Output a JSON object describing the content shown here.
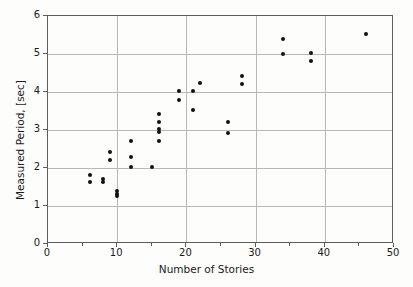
{
  "chart_data": {
    "type": "scatter",
    "title": "",
    "xlabel": "Number of Stories",
    "ylabel": "Measured Period, [sec]",
    "xlim": [
      0,
      50
    ],
    "ylim": [
      0,
      6
    ],
    "xticks": [
      0,
      10,
      20,
      30,
      40,
      50
    ],
    "yticks": [
      0,
      1,
      2,
      3,
      4,
      5,
      6
    ],
    "xtick_labels": [
      "0",
      "10",
      "20",
      "30",
      "40",
      "50"
    ],
    "ytick_labels": [
      "0",
      "1",
      "2",
      "3",
      "4",
      "5",
      "6"
    ],
    "x_minor_ticks": [
      5,
      15,
      25,
      35,
      45
    ],
    "grid": true,
    "grid_color": "#b9b9b9",
    "legend": null,
    "marker": "circle",
    "marker_color": "#111111",
    "marker_size": 4,
    "points": [
      {
        "x": 6,
        "y": 1.82
      },
      {
        "x": 6,
        "y": 1.62
      },
      {
        "x": 8,
        "y": 1.7
      },
      {
        "x": 8,
        "y": 1.62
      },
      {
        "x": 9,
        "y": 2.42
      },
      {
        "x": 9,
        "y": 2.22
      },
      {
        "x": 10,
        "y": 1.4
      },
      {
        "x": 10,
        "y": 1.32
      },
      {
        "x": 10,
        "y": 1.26
      },
      {
        "x": 12,
        "y": 2.72
      },
      {
        "x": 12,
        "y": 2.3
      },
      {
        "x": 12,
        "y": 2.02
      },
      {
        "x": 15,
        "y": 2.02
      },
      {
        "x": 16,
        "y": 3.42
      },
      {
        "x": 16,
        "y": 3.22
      },
      {
        "x": 16,
        "y": 3.02
      },
      {
        "x": 16,
        "y": 2.94
      },
      {
        "x": 16,
        "y": 2.72
      },
      {
        "x": 19,
        "y": 4.02
      },
      {
        "x": 19,
        "y": 3.8
      },
      {
        "x": 21,
        "y": 4.02
      },
      {
        "x": 21,
        "y": 3.52
      },
      {
        "x": 22,
        "y": 4.25
      },
      {
        "x": 26,
        "y": 3.22
      },
      {
        "x": 26,
        "y": 2.92
      },
      {
        "x": 28,
        "y": 4.42
      },
      {
        "x": 28,
        "y": 4.2
      },
      {
        "x": 34,
        "y": 5.4
      },
      {
        "x": 34,
        "y": 5.0
      },
      {
        "x": 38,
        "y": 5.02
      },
      {
        "x": 38,
        "y": 4.82
      },
      {
        "x": 46,
        "y": 5.52
      }
    ]
  }
}
